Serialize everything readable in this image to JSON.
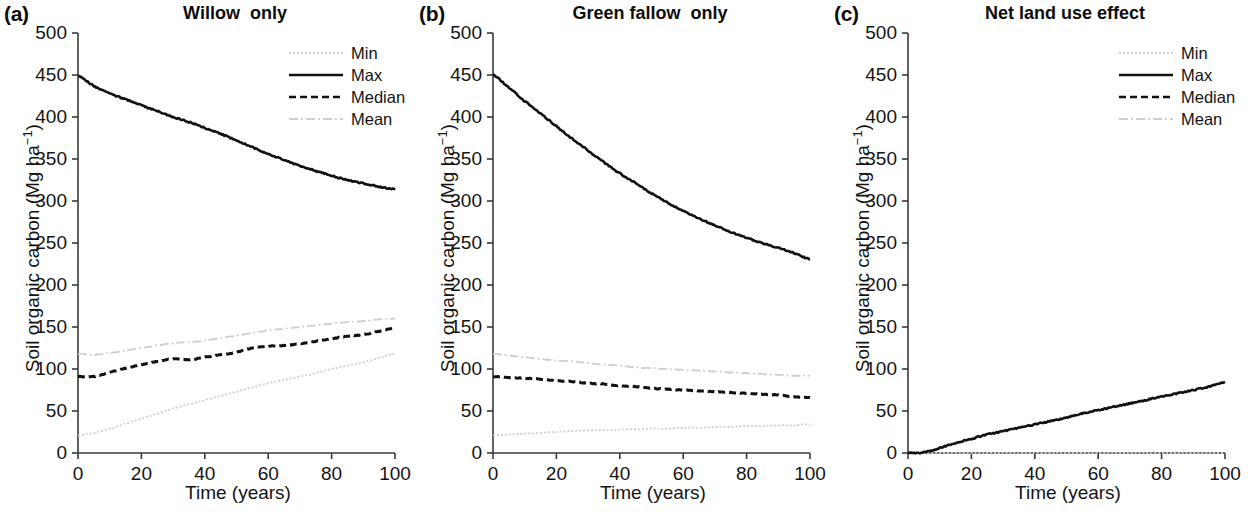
{
  "figure": {
    "xlabel": "Time (years)",
    "ylabel_main": "Soil organic carbon (Mg ha",
    "ylabel_sup": "−1",
    "ylabel_close": ")",
    "ylabel_full": "Soil organic carbon (Mg ha−1)",
    "yticks": [
      "0",
      "50",
      "100",
      "150",
      "200",
      "250",
      "300",
      "350",
      "400",
      "450",
      "500"
    ],
    "xticks": [
      "0",
      "20",
      "40",
      "60",
      "80",
      "100"
    ],
    "colors": {
      "axis": "#3a3a3a",
      "solid_black": "#111111",
      "dashed_black": "#111111",
      "faint_gray": "#cfcfcf",
      "text": "#141414"
    }
  },
  "panels": [
    {
      "letter": "(a)",
      "title": "Willow  only",
      "legend": [
        {
          "label": "Min",
          "style": "dotted-faint"
        },
        {
          "label": "Max",
          "style": "solid-black"
        },
        {
          "label": "Median",
          "style": "dashed-black"
        },
        {
          "label": "Mean",
          "style": "dashdot-faint"
        }
      ]
    },
    {
      "letter": "(b)",
      "title": "Green fallow  only",
      "legend": [
        {
          "label": "Min",
          "style": "dotted-faint"
        },
        {
          "label": "Max",
          "style": "solid-black"
        },
        {
          "label": "Median",
          "style": "dashed-black"
        },
        {
          "label": "Mean",
          "style": "dashdot-faint"
        }
      ]
    },
    {
      "letter": "(c)",
      "title": "Net land use effect",
      "legend": [
        {
          "label": "Min",
          "style": "dotted-faint"
        },
        {
          "label": "Max",
          "style": "solid-black"
        }
      ]
    }
  ],
  "chart_data": [
    {
      "type": "line",
      "title": "Willow  only",
      "panel": "(a)",
      "xlabel": "Time (years)",
      "ylabel": "Soil organic carbon (Mg ha−1)",
      "xlim": [
        0,
        100
      ],
      "ylim": [
        0,
        500
      ],
      "xticks": [
        0,
        20,
        40,
        60,
        80,
        100
      ],
      "yticks": [
        0,
        50,
        100,
        150,
        200,
        250,
        300,
        350,
        400,
        450,
        500
      ],
      "grid": false,
      "legend_position": "top-right",
      "x": [
        0,
        5,
        10,
        15,
        20,
        25,
        30,
        35,
        40,
        45,
        50,
        55,
        60,
        65,
        70,
        75,
        80,
        85,
        90,
        95,
        100
      ],
      "series": [
        {
          "name": "Max",
          "style": "solid-black",
          "values": [
            449,
            437,
            428,
            421,
            414,
            407,
            400,
            394,
            387,
            380,
            372,
            364,
            356,
            349,
            342,
            336,
            330,
            325,
            321,
            317,
            314
          ]
        },
        {
          "name": "Median",
          "style": "dashed-black",
          "values": [
            91,
            91,
            96,
            101,
            105,
            109,
            112,
            111,
            114,
            117,
            120,
            125,
            127,
            128,
            130,
            133,
            136,
            139,
            141,
            145,
            149
          ]
        },
        {
          "name": "Mean",
          "style": "dashdot-faint",
          "values": [
            118,
            117,
            119,
            122,
            125,
            128,
            131,
            132,
            134,
            137,
            140,
            143,
            146,
            148,
            150,
            152,
            154,
            156,
            157,
            159,
            160
          ]
        },
        {
          "name": "Min",
          "style": "dotted-faint",
          "values": [
            21,
            24,
            29,
            35,
            41,
            47,
            53,
            58,
            63,
            68,
            73,
            78,
            83,
            87,
            91,
            95,
            100,
            104,
            108,
            113,
            118
          ]
        }
      ]
    },
    {
      "type": "line",
      "title": "Green fallow  only",
      "panel": "(b)",
      "xlabel": "Time (years)",
      "ylabel": "Soil organic carbon (Mg ha−1)",
      "xlim": [
        0,
        100
      ],
      "ylim": [
        0,
        500
      ],
      "xticks": [
        0,
        20,
        40,
        60,
        80,
        100
      ],
      "yticks": [
        0,
        50,
        100,
        150,
        200,
        250,
        300,
        350,
        400,
        450,
        500
      ],
      "grid": false,
      "legend_position": "top-right",
      "x": [
        0,
        5,
        10,
        15,
        20,
        25,
        30,
        35,
        40,
        45,
        50,
        55,
        60,
        65,
        70,
        75,
        80,
        85,
        90,
        95,
        100
      ],
      "series": [
        {
          "name": "Max",
          "style": "solid-black",
          "values": [
            450,
            435,
            419,
            404,
            389,
            374,
            360,
            346,
            333,
            321,
            309,
            298,
            288,
            279,
            271,
            263,
            256,
            250,
            244,
            238,
            231
          ]
        },
        {
          "name": "Median",
          "style": "dashed-black",
          "values": [
            91,
            90,
            89,
            88,
            86,
            85,
            83,
            82,
            80,
            79,
            77,
            76,
            75,
            74,
            73,
            72,
            71,
            70,
            69,
            67,
            66
          ]
        },
        {
          "name": "Mean",
          "style": "dashdot-faint",
          "values": [
            118,
            116,
            114,
            112,
            110,
            109,
            107,
            105,
            104,
            102,
            101,
            100,
            99,
            98,
            97,
            96,
            95,
            94,
            93,
            92,
            92
          ]
        },
        {
          "name": "Min",
          "style": "dotted-faint",
          "values": [
            21,
            22,
            23,
            24,
            25,
            26,
            27,
            27,
            28,
            28,
            29,
            29,
            30,
            30,
            31,
            31,
            32,
            32,
            33,
            33,
            34
          ]
        }
      ]
    },
    {
      "type": "line",
      "title": "Net land use effect",
      "panel": "(c)",
      "xlabel": "Time (years)",
      "ylabel": "Soil organic carbon (Mg ha−1)",
      "xlim": [
        0,
        100
      ],
      "ylim": [
        0,
        500
      ],
      "xticks": [
        0,
        20,
        40,
        60,
        80,
        100
      ],
      "yticks": [
        0,
        50,
        100,
        150,
        200,
        250,
        300,
        350,
        400,
        450,
        500
      ],
      "grid": false,
      "legend_position": "top-right",
      "x": [
        0,
        5,
        10,
        15,
        20,
        25,
        30,
        35,
        40,
        45,
        50,
        55,
        60,
        65,
        70,
        75,
        80,
        85,
        90,
        95,
        100
      ],
      "series": [
        {
          "name": "Max",
          "style": "solid-black",
          "values": [
            0,
            1,
            6,
            12,
            17,
            22,
            26,
            30,
            34,
            38,
            42,
            47,
            51,
            55,
            59,
            63,
            67,
            71,
            75,
            79,
            84
          ]
        },
        {
          "name": "Min",
          "style": "dotted-faint",
          "values": [
            0,
            0,
            0,
            0,
            0,
            0,
            0,
            0,
            0,
            0,
            0,
            0,
            0,
            0,
            0,
            0,
            0,
            0,
            0,
            0,
            0
          ]
        }
      ]
    }
  ]
}
